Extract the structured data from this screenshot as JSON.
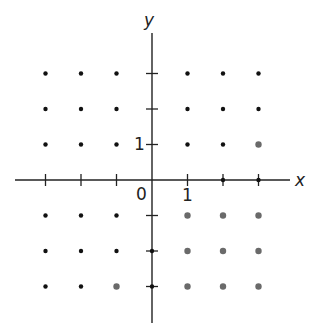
{
  "figure": {
    "type": "lattice-points-diagram",
    "axes": {
      "x_label": "x",
      "y_label": "y",
      "origin_label": "0",
      "x_unit_label": "1",
      "y_unit_label": "1",
      "x_ticks": [
        -3,
        -2,
        -1,
        1,
        2,
        3
      ],
      "y_ticks": [
        -3,
        -2,
        -1,
        1,
        2,
        3
      ]
    },
    "colors": {
      "axis": "#222222",
      "dot_black": "#111111",
      "dot_gray": "#6a6a6a",
      "background": "#ffffff"
    },
    "quadrant_points": {
      "II": {
        "color": "black",
        "points": [
          [
            -3,
            3
          ],
          [
            -2,
            3
          ],
          [
            -1,
            3
          ],
          [
            -3,
            2
          ],
          [
            -2,
            2
          ],
          [
            -1,
            2
          ],
          [
            -3,
            1
          ],
          [
            -2,
            1
          ],
          [
            -1,
            1
          ]
        ]
      },
      "I": {
        "color": "mixed",
        "points": [
          [
            1,
            3,
            "black"
          ],
          [
            2,
            3,
            "black"
          ],
          [
            3,
            3,
            "black"
          ],
          [
            1,
            2,
            "black"
          ],
          [
            2,
            2,
            "black"
          ],
          [
            3,
            2,
            "black"
          ],
          [
            1,
            1,
            "black"
          ],
          [
            2,
            1,
            "black"
          ],
          [
            3,
            1,
            "gray"
          ]
        ]
      },
      "III": {
        "color": "mixed",
        "points": [
          [
            -3,
            -1,
            "black"
          ],
          [
            -2,
            -1,
            "black"
          ],
          [
            -1,
            -1,
            "black"
          ],
          [
            -3,
            -2,
            "black"
          ],
          [
            -2,
            -2,
            "black"
          ],
          [
            -1,
            -2,
            "black"
          ],
          [
            -3,
            -3,
            "black"
          ],
          [
            -2,
            -3,
            "black"
          ],
          [
            -1,
            -3,
            "gray"
          ]
        ]
      },
      "IV": {
        "color": "gray",
        "points": [
          [
            1,
            -1
          ],
          [
            2,
            -1
          ],
          [
            3,
            -1
          ],
          [
            1,
            -2
          ],
          [
            2,
            -2
          ],
          [
            3,
            -2
          ],
          [
            1,
            -3
          ],
          [
            2,
            -3
          ],
          [
            3,
            -3
          ]
        ]
      }
    },
    "axis_points": [
      [
        2,
        0
      ],
      [
        3,
        0
      ],
      [
        0,
        -2
      ],
      [
        0,
        -3
      ]
    ]
  }
}
